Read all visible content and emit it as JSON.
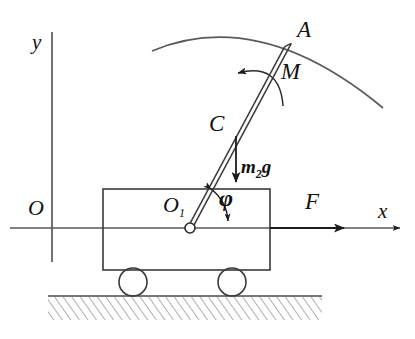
{
  "figure": {
    "kind": "mechanics-free-body-diagram",
    "background_color": "#ffffff",
    "line_color": "#3a3a3a",
    "ink_color": "#111111"
  },
  "axes": {
    "origin_label": "O",
    "x_label": "x",
    "y_label": "y",
    "x_axis": {
      "y": 228,
      "x_start": 10,
      "x_end": 402
    },
    "y_axis": {
      "x": 52,
      "y_start": 32,
      "y_end": 262
    }
  },
  "labels": {
    "point_A": "A",
    "point_C": "C",
    "pivot": "O",
    "pivot_subscript": "1",
    "moment": "M",
    "force": "F",
    "angle": "φ",
    "weight_prefix": "m",
    "weight_subscript": "2",
    "weight_suffix": "g"
  },
  "rod": {
    "pivot": {
      "x": 190,
      "y": 228
    },
    "tip": {
      "x": 288,
      "y": 45
    },
    "center_of_mass": {
      "x": 236,
      "y": 137
    },
    "half_width": 3.2,
    "pivot_circle_radius": 5
  },
  "cart": {
    "body": {
      "x": 103,
      "y": 189,
      "width": 167,
      "height": 81
    },
    "wheels": [
      {
        "cx": 133,
        "cy": 282,
        "r": 14
      },
      {
        "cx": 232,
        "cy": 282,
        "r": 14
      }
    ]
  },
  "ground": {
    "line_y": 296,
    "x_start": 48,
    "x_end": 322,
    "hatch_depth": 24,
    "hatch_spacing": 7
  },
  "trajectory_arc": {
    "start": {
      "x": 152,
      "y": 51
    },
    "control": {
      "x": 260,
      "y": 6
    },
    "end": {
      "x": 383,
      "y": 108
    }
  },
  "moment_arc": {
    "start": {
      "x": 283,
      "y": 106
    },
    "control": {
      "x": 276,
      "y": 58
    },
    "end": {
      "x": 236,
      "y": 73
    },
    "arrow_direction": "counterclockwise-left"
  },
  "weight_arrow": {
    "from": {
      "x": 236,
      "y": 137
    },
    "to": {
      "x": 236,
      "y": 182
    }
  },
  "force_arrow": {
    "from": {
      "x": 270,
      "y": 228
    },
    "to": {
      "x": 344,
      "y": 228
    }
  },
  "angle_arc": {
    "center": {
      "x": 190,
      "y": 228
    },
    "radius": 44,
    "from_deg": 62,
    "to_deg": 0
  }
}
